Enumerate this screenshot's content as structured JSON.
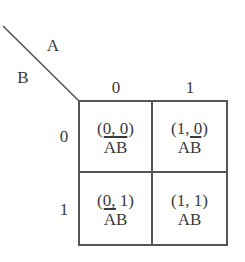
{
  "diagram": {
    "type": "karnaugh-map",
    "variables": {
      "column_variable": "A",
      "row_variable": "B"
    },
    "column_headers": [
      "0",
      "1"
    ],
    "row_headers": [
      "0",
      "1"
    ],
    "cells": [
      [
        {
          "coord": "(0, 0)",
          "term": [
            {
              "letter": "A",
              "negated": true
            },
            {
              "letter": "B",
              "negated": true
            }
          ],
          "term_text": "ĀB̄"
        },
        {
          "coord": "(1, 0)",
          "term": [
            {
              "letter": "A",
              "negated": false
            },
            {
              "letter": "B",
              "negated": true
            }
          ],
          "term_text": "AB̄"
        }
      ],
      [
        {
          "coord": "(0, 1)",
          "term": [
            {
              "letter": "A",
              "negated": true
            },
            {
              "letter": "B",
              "negated": false
            }
          ],
          "term_text": "ĀB"
        },
        {
          "coord": "(1, 1)",
          "term": [
            {
              "letter": "A",
              "negated": false
            },
            {
              "letter": "B",
              "negated": false
            }
          ],
          "term_text": "AB"
        }
      ]
    ],
    "colors": {
      "line": "#555555",
      "text": "#3a3a3a",
      "background": "#ffffff"
    }
  }
}
